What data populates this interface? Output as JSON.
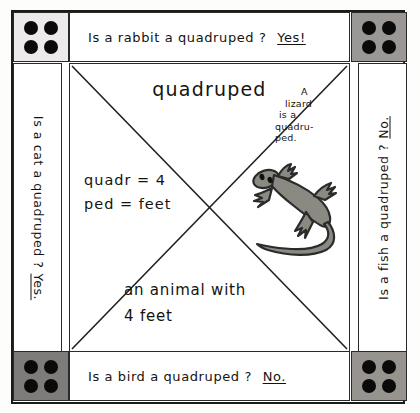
{
  "worksheet": {
    "title_word": "quadruped",
    "top_banner": {
      "question": "Is a rabbit a quadruped ?",
      "answer": "Yes!"
    },
    "bottom_banner": {
      "question": "Is  a  bird  a  quadruped ?",
      "answer": "No."
    },
    "left_banner": {
      "question": "Is a cat a quadruped ?",
      "answer": "Yes."
    },
    "right_banner": {
      "question": "Is a fish a quadruped ?",
      "answer": "No."
    },
    "quadrants": {
      "north_label": "quadruped",
      "west_lines": [
        "quadr = 4",
        "ped = feet"
      ],
      "south_lines": [
        "an  animal with",
        "4 feet"
      ],
      "east_note_lines": [
        "A",
        "lizard",
        "is a",
        "quadru-",
        "ped."
      ],
      "east_illustration": "lizard-drawing"
    },
    "corners": [
      {
        "name": "top-left",
        "pips": 4,
        "shade": "#eceaea"
      },
      {
        "name": "top-right",
        "pips": 4,
        "shade": "#9a9795"
      },
      {
        "name": "bottom-left",
        "pips": 4,
        "shade": "#7e7c7a"
      },
      {
        "name": "bottom-right",
        "pips": 4,
        "shade": "#97948f"
      }
    ],
    "colors": {
      "ink": "#15130f",
      "frame": "#1b1b1b",
      "paper": "#ffffff",
      "lizard_body": "#8a8a82",
      "lizard_outline": "#2b2b2b"
    }
  }
}
